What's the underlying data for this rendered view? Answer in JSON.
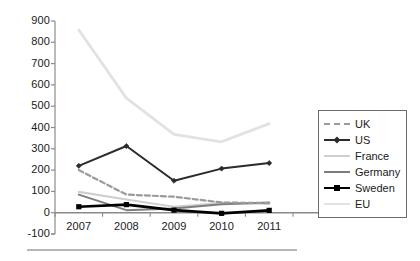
{
  "chart_data": {
    "type": "line",
    "title": "",
    "xlabel": "",
    "ylabel": "",
    "categories": [
      "2007",
      "2008",
      "2009",
      "2010",
      "2011"
    ],
    "x_tick_labels": [
      "2007",
      "2008",
      "2009",
      "2010",
      "2011"
    ],
    "y_tick_labels": [
      "900",
      "800",
      "700",
      "600",
      "500",
      "400",
      "300",
      "200",
      "100",
      "0",
      "-100"
    ],
    "y_ticks": [
      900,
      800,
      700,
      600,
      500,
      400,
      300,
      200,
      100,
      0,
      -100
    ],
    "ylim": [
      -100,
      900
    ],
    "grid": false,
    "legend_position": "right",
    "series": [
      {
        "name": "UK",
        "values": [
          200,
          85,
          75,
          48,
          45
        ],
        "color": "#9a9a9a",
        "style": "dashed",
        "marker": "none",
        "width": 2.2
      },
      {
        "name": "US",
        "values": [
          220,
          313,
          150,
          207,
          233
        ],
        "color": "#2b2b2b",
        "style": "solid",
        "marker": "diamond",
        "width": 2.0
      },
      {
        "name": "France",
        "values": [
          98,
          62,
          28,
          45,
          43
        ],
        "color": "#cfcfcf",
        "style": "solid",
        "marker": "none",
        "width": 2.2
      },
      {
        "name": "Germany",
        "values": [
          85,
          12,
          20,
          40,
          48
        ],
        "color": "#7d7d7d",
        "style": "solid",
        "marker": "none",
        "width": 2.0
      },
      {
        "name": "Sweden",
        "values": [
          28,
          38,
          12,
          -3,
          11
        ],
        "color": "#000000",
        "style": "solid",
        "marker": "square",
        "width": 2.6
      },
      {
        "name": "EU",
        "values": [
          858,
          538,
          368,
          333,
          418
        ],
        "color": "#e2e2e2",
        "style": "solid",
        "marker": "none",
        "width": 2.8
      }
    ],
    "axis_color": "#8c8c8c",
    "baseline_color": "#8a8a8a",
    "text_color": "#1a1a1a"
  },
  "legend": {
    "entries": [
      "UK",
      "US",
      "France",
      "Germany",
      "Sweden",
      "EU"
    ]
  }
}
